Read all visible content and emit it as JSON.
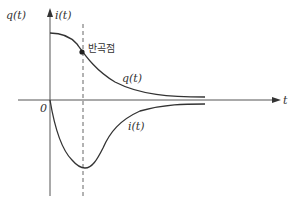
{
  "diagram": {
    "axis_labels": {
      "y_left": "q(t)",
      "y_right": "i(t)",
      "x": "t",
      "origin": "0"
    },
    "annotations": {
      "inflection_point": "반곡점"
    },
    "curves": {
      "charge": "q(t)",
      "current": "i(t)"
    },
    "colors": {
      "line": "#333333",
      "axis": "#555555",
      "dashed": "#666666"
    }
  }
}
